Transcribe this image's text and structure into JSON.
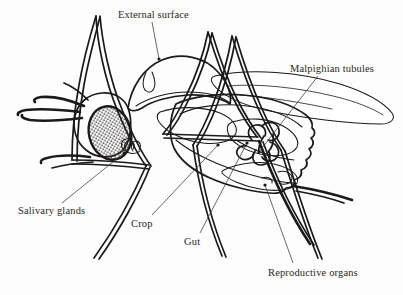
{
  "figure": {
    "style": "black ink line drawing on white background",
    "background_color": "#ffffff",
    "ink_color": "#1c1a19",
    "label_color": "#2b2724"
  },
  "labels": [
    {
      "id": "external-surface",
      "text": "External surface",
      "x": 118,
      "y": 9,
      "leader": {
        "from_x": 152,
        "from_y": 22,
        "to_x": 159,
        "to_y": 59
      },
      "marker": {
        "x": 159,
        "y": 59
      }
    },
    {
      "id": "malpighian-tubules",
      "text": "Malpighian tubules",
      "x": 290,
      "y": 63,
      "leader": {
        "from_x": 318,
        "from_y": 76,
        "to_x": 259,
        "to_y": 152
      },
      "marker": {
        "x": 259,
        "y": 152
      }
    },
    {
      "id": "salivary-glands",
      "text": "Salivary glands",
      "x": 18,
      "y": 205,
      "leader": {
        "from_x": 62,
        "from_y": 203,
        "to_x": 124,
        "to_y": 153
      },
      "marker": {
        "x": 124,
        "y": 153
      }
    },
    {
      "id": "crop",
      "text": "Crop",
      "x": 131,
      "y": 218,
      "leader": {
        "from_x": 152,
        "from_y": 215,
        "to_x": 218,
        "to_y": 145
      },
      "marker": {
        "x": 218,
        "y": 145
      }
    },
    {
      "id": "gut",
      "text": "Gut",
      "x": 184,
      "y": 236,
      "leader": {
        "from_x": 200,
        "from_y": 233,
        "to_x": 247,
        "to_y": 143
      },
      "marker": {
        "x": 247,
        "y": 143
      }
    },
    {
      "id": "reproductive-organs",
      "text": "Reproductive organs",
      "x": 268,
      "y": 267,
      "leader": {
        "from_x": 293,
        "from_y": 263,
        "to_x": 265,
        "to_y": 185
      },
      "marker": {
        "x": 265,
        "y": 185
      }
    }
  ],
  "anatomy_parts": [
    "external surface",
    "Malpighian tubules",
    "salivary glands",
    "crop",
    "gut",
    "reproductive organs",
    "compound eye",
    "proboscis",
    "antennae",
    "wing",
    "legs",
    "thorax",
    "abdomen"
  ]
}
